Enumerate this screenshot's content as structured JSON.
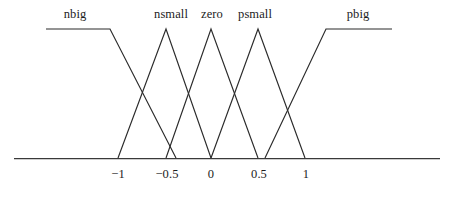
{
  "figure": {
    "title": "",
    "background_color": "#ffffff",
    "line_color": "#2b2b2b",
    "axis_color": "#3a3a3a",
    "width": 452,
    "height": 203
  },
  "axis": {
    "baseline_y": 158,
    "plateau_y": 29,
    "left_end_x": 14,
    "right_end_x": 440,
    "ticks": [
      {
        "label": "−1",
        "value": -1,
        "x": 118
      },
      {
        "label": "−0.5",
        "value": -0.5,
        "x": 166
      },
      {
        "label": "0",
        "value": 0,
        "x": 211
      },
      {
        "label": "0.5",
        "value": 0.5,
        "x": 258
      },
      {
        "label": "1",
        "value": 1,
        "x": 305
      }
    ]
  },
  "set_labels": [
    {
      "name": "nbig",
      "text": "nbig",
      "x": 75
    },
    {
      "name": "nsmall",
      "text": "nsmall",
      "x": 171
    },
    {
      "name": "zero",
      "text": "zero",
      "x": 212
    },
    {
      "name": "psmall",
      "text": "psmall",
      "x": 255
    },
    {
      "name": "pbig",
      "text": "pbig",
      "x": 358
    }
  ],
  "chart_data": {
    "type": "line",
    "title": "",
    "subtitle": "",
    "xlabel": "",
    "ylabel": "",
    "xlim": [
      -1.5,
      1.5
    ],
    "ylim": [
      0,
      1
    ],
    "grid": false,
    "legend": "inline-above-curves",
    "x_ticks": [
      -1,
      -0.5,
      0,
      0.5,
      1
    ],
    "x_tick_labels": [
      "−1",
      "−0.5",
      "0",
      "0.5",
      "1"
    ],
    "series": [
      {
        "name": "nbig",
        "shape": "trapezoid-left-shoulder",
        "points": [
          [
            -1.75,
            1
          ],
          [
            -1.1,
            1
          ],
          [
            -0.38,
            0
          ]
        ],
        "pixel_points": [
          [
            46,
            29
          ],
          [
            110,
            29
          ],
          [
            176,
            158
          ]
        ]
      },
      {
        "name": "nsmall",
        "shape": "triangle",
        "points": [
          [
            -1.0,
            0
          ],
          [
            -0.5,
            1
          ],
          [
            0.0,
            0
          ]
        ],
        "pixel_points": [
          [
            118,
            158
          ],
          [
            166,
            29
          ],
          [
            211,
            158
          ]
        ]
      },
      {
        "name": "zero",
        "shape": "triangle",
        "points": [
          [
            -0.5,
            0
          ],
          [
            0.0,
            1
          ],
          [
            0.5,
            0
          ]
        ],
        "pixel_points": [
          [
            166,
            158
          ],
          [
            211,
            29
          ],
          [
            258,
            158
          ]
        ]
      },
      {
        "name": "psmall",
        "shape": "triangle",
        "points": [
          [
            0.0,
            0
          ],
          [
            0.5,
            1
          ],
          [
            1.0,
            0
          ]
        ],
        "pixel_points": [
          [
            211,
            158
          ],
          [
            258,
            29
          ],
          [
            305,
            158
          ]
        ]
      },
      {
        "name": "pbig",
        "shape": "trapezoid-right-shoulder",
        "points": [
          [
            0.58,
            0
          ],
          [
            1.23,
            1
          ],
          [
            1.93,
            1
          ]
        ],
        "pixel_points": [
          [
            265,
            158
          ],
          [
            326,
            29
          ],
          [
            392,
            29
          ]
        ]
      }
    ]
  }
}
